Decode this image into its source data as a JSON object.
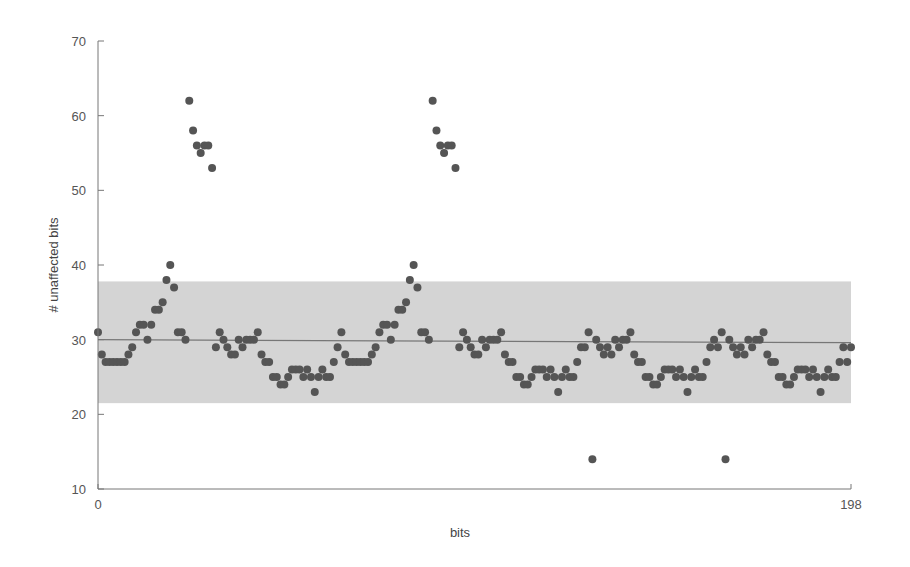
{
  "chart_data": {
    "type": "scatter",
    "title": "",
    "xlabel": "bits",
    "ylabel": "# unaffected bits",
    "xlim": [
      0,
      198
    ],
    "ylim": [
      10,
      70
    ],
    "x_ticks": [
      0,
      198
    ],
    "y_ticks": [
      10,
      20,
      30,
      40,
      50,
      60,
      70
    ],
    "grid": false,
    "legend": null,
    "band": {
      "lower": 21.5,
      "upper": 37.8,
      "color": "#d4d4d4",
      "label": "expected range"
    },
    "mean_line": {
      "start": 30.0,
      "end": 29.6,
      "color": "#777777"
    },
    "marker_color": "#555555",
    "series": [
      {
        "name": "# unaffected bits",
        "x": [
          0,
          1,
          2,
          3,
          4,
          5,
          6,
          7,
          8,
          9,
          10,
          11,
          12,
          13,
          14,
          15,
          16,
          17,
          18,
          19,
          20,
          21,
          22,
          23,
          24,
          25,
          26,
          27,
          28,
          29,
          30,
          31,
          32,
          33,
          34,
          35,
          36,
          37,
          38,
          39,
          40,
          41,
          42,
          43,
          44,
          45,
          46,
          47,
          48,
          49,
          50,
          51,
          52,
          53,
          54,
          55,
          56,
          57,
          58,
          59,
          60,
          61,
          62,
          63,
          64,
          65,
          66,
          67,
          68,
          69,
          70,
          71,
          72,
          73,
          74,
          75,
          76,
          77,
          78,
          79,
          80,
          81,
          82,
          83,
          84,
          85,
          86,
          87,
          88,
          89,
          90,
          91,
          92,
          93,
          94,
          95,
          96,
          97,
          98,
          99,
          100,
          101,
          102,
          103,
          104,
          105,
          106,
          107,
          108,
          109,
          110,
          111,
          112,
          113,
          114,
          115,
          116,
          117,
          118,
          119,
          120,
          121,
          122,
          123,
          124,
          125,
          126,
          127,
          128,
          129,
          130,
          131,
          132,
          133,
          134,
          135,
          136,
          137,
          138,
          139,
          140,
          141,
          142,
          143,
          144,
          145,
          146,
          147,
          148,
          149,
          150,
          151,
          152,
          153,
          154,
          155,
          156,
          157,
          158,
          159,
          160,
          161,
          162,
          163,
          164,
          165,
          166,
          167,
          168,
          169,
          170,
          171,
          172,
          173,
          174,
          175,
          176,
          177,
          178,
          179,
          180,
          181,
          182,
          183,
          184,
          185,
          186,
          187,
          188,
          189,
          190,
          191,
          192,
          193,
          194,
          195,
          196,
          197,
          198
        ],
        "values": [
          31,
          28,
          27,
          27,
          27,
          27,
          27,
          27,
          28,
          29,
          31,
          32,
          32,
          30,
          32,
          34,
          34,
          35,
          38,
          40,
          37,
          31,
          31,
          30,
          62,
          58,
          56,
          55,
          56,
          56,
          53,
          29,
          31,
          30,
          29,
          28,
          28,
          30,
          29,
          30,
          30,
          30,
          31,
          28,
          27,
          27,
          25,
          25,
          24,
          24,
          25,
          26,
          26,
          26,
          25,
          26,
          25,
          23,
          25,
          26,
          25,
          25,
          27,
          29,
          31,
          28,
          27,
          27,
          27,
          27,
          27,
          27,
          28,
          29,
          31,
          32,
          32,
          30,
          32,
          34,
          34,
          35,
          38,
          40,
          37,
          31,
          31,
          30,
          62,
          58,
          56,
          55,
          56,
          56,
          53,
          29,
          31,
          30,
          29,
          28,
          28,
          30,
          29,
          30,
          30,
          30,
          31,
          28,
          27,
          27,
          25,
          25,
          24,
          24,
          25,
          26,
          26,
          26,
          25,
          26,
          25,
          23,
          25,
          26,
          25,
          25,
          27,
          29,
          29,
          31,
          14,
          30,
          29,
          28,
          29,
          28,
          30,
          29,
          30,
          30,
          31,
          28,
          27,
          27,
          25,
          25,
          24,
          24,
          25,
          26,
          26,
          26,
          25,
          26,
          25,
          23,
          25,
          26,
          25,
          25,
          27,
          29,
          30,
          29,
          31,
          14,
          30,
          29,
          28,
          29,
          28,
          30,
          29,
          30,
          30,
          31,
          28,
          27,
          27,
          25,
          25,
          24,
          24,
          25,
          26,
          26,
          26,
          25,
          26,
          25,
          23,
          25,
          26,
          25,
          25,
          27,
          29,
          27,
          29
        ]
      }
    ]
  }
}
